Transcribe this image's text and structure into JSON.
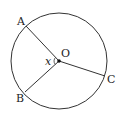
{
  "diagram": {
    "center_label": "O",
    "angle_label": "x",
    "points": [
      {
        "id": "A",
        "label": "A"
      },
      {
        "id": "B",
        "label": "B"
      },
      {
        "id": "C",
        "label": "C"
      }
    ],
    "segments": [
      "OA",
      "OB",
      "OC"
    ],
    "angle_marked": "AOB",
    "colors": {
      "stroke": "#333333",
      "text": "#222222"
    }
  }
}
